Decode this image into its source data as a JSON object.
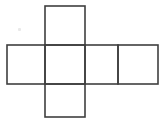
{
  "figure": {
    "title": "",
    "type": "cube-net-diagram",
    "background_color": "#ffffff",
    "line_color": "#3f3f3f",
    "line_width": 1.6,
    "canvas": {
      "width": 165,
      "height": 122
    },
    "grid": {
      "vertical_line_x": [
        7,
        45,
        85,
        118,
        158
      ],
      "horizontal_line_y": [
        6,
        45,
        84,
        117
      ]
    },
    "squares": [
      {
        "name": "top-square",
        "x": 45,
        "y": 6,
        "width": 40,
        "height": 39,
        "label": ""
      },
      {
        "name": "band-square-left",
        "x": 7,
        "y": 45,
        "width": 38,
        "height": 39,
        "label": ""
      },
      {
        "name": "band-square-center",
        "x": 45,
        "y": 45,
        "width": 40,
        "height": 39,
        "label": ""
      },
      {
        "name": "band-square-right",
        "x": 85,
        "y": 45,
        "width": 33,
        "height": 39,
        "label": ""
      },
      {
        "name": "band-square-far-right",
        "x": 118,
        "y": 45,
        "width": 40,
        "height": 39,
        "label": ""
      },
      {
        "name": "bottom-square",
        "x": 45,
        "y": 84,
        "width": 40,
        "height": 33,
        "label": ""
      }
    ],
    "artifacts": [
      {
        "name": "speck-mark",
        "x": 18,
        "y": 28,
        "color": "#e9e9e9"
      }
    ]
  }
}
